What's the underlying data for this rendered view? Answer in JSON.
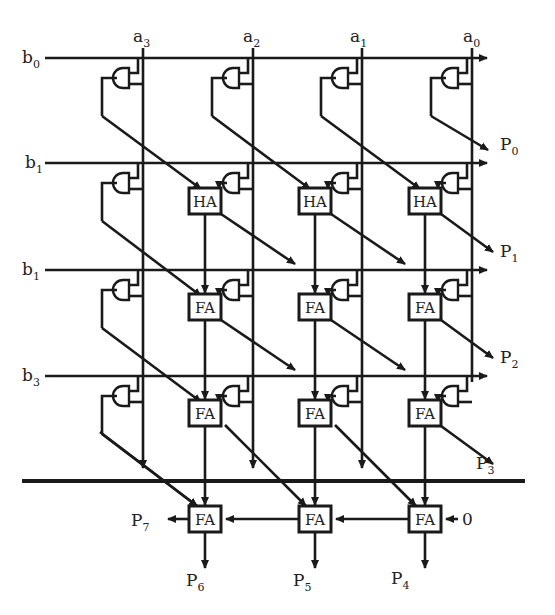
{
  "diagram": {
    "type": "array-multiplier-4x4",
    "inputs_a": [
      {
        "base": "a",
        "sub": "3"
      },
      {
        "base": "a",
        "sub": "2"
      },
      {
        "base": "a",
        "sub": "1"
      },
      {
        "base": "a",
        "sub": "0"
      }
    ],
    "inputs_b": [
      {
        "base": "b",
        "sub": "0"
      },
      {
        "base": "b",
        "sub": "1"
      },
      {
        "base": "b",
        "sub": "1"
      },
      {
        "base": "b",
        "sub": "3"
      }
    ],
    "outputs_right": [
      {
        "base": "P",
        "sub": "0"
      },
      {
        "base": "P",
        "sub": "1"
      },
      {
        "base": "P",
        "sub": "2"
      },
      {
        "base": "P",
        "sub": "3"
      }
    ],
    "outputs_bottom": [
      {
        "base": "P",
        "sub": "6"
      },
      {
        "base": "P",
        "sub": "5"
      },
      {
        "base": "P",
        "sub": "4"
      }
    ],
    "output_left": {
      "base": "P",
      "sub": "7"
    },
    "carry_in": "0",
    "adder_rows": [
      [
        "HA",
        "HA",
        "HA"
      ],
      [
        "FA",
        "FA",
        "FA"
      ],
      [
        "FA",
        "FA",
        "FA"
      ]
    ],
    "final_row": [
      "FA",
      "FA",
      "FA"
    ],
    "gate_type": "AND"
  }
}
